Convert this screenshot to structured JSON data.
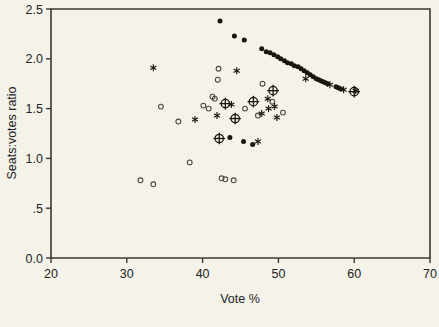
{
  "chart_data": {
    "type": "scatter",
    "title": "",
    "xlabel": "Vote %",
    "ylabel": "Seats:votes ratio",
    "xlim": [
      20,
      70
    ],
    "ylim": [
      0,
      2.5
    ],
    "xticks": [
      20,
      30,
      40,
      50,
      60,
      70
    ],
    "xtick_labels": [
      "20",
      "30",
      "40",
      "50",
      "60",
      "70"
    ],
    "yticks": [
      0,
      0.5,
      1.0,
      1.5,
      2.0,
      2.5
    ],
    "ytick_labels": [
      "0.0",
      ".5",
      "1.0",
      "1.5",
      "2.0",
      "2.5"
    ],
    "grid": false,
    "legend": "none",
    "series": [
      {
        "name": "filled-circle",
        "marker": "filled-circle",
        "points": [
          [
            42.3,
            2.38
          ],
          [
            44.2,
            2.23
          ],
          [
            45.5,
            2.19
          ],
          [
            47.8,
            2.1
          ],
          [
            48.4,
            2.07
          ],
          [
            48.9,
            2.06
          ],
          [
            49.4,
            2.04
          ],
          [
            49.9,
            2.02
          ],
          [
            50.3,
            2.0
          ],
          [
            50.8,
            1.98
          ],
          [
            51.2,
            1.96
          ],
          [
            51.7,
            1.95
          ],
          [
            52.1,
            1.93
          ],
          [
            52.6,
            1.92
          ],
          [
            53.0,
            1.9
          ],
          [
            53.4,
            1.88
          ],
          [
            53.8,
            1.86
          ],
          [
            54.2,
            1.84
          ],
          [
            54.6,
            1.82
          ],
          [
            55.0,
            1.8
          ],
          [
            55.3,
            1.79
          ],
          [
            55.6,
            1.78
          ],
          [
            55.9,
            1.77
          ],
          [
            56.2,
            1.76
          ],
          [
            56.5,
            1.75
          ],
          [
            57.6,
            1.72
          ],
          [
            57.9,
            1.71
          ],
          [
            58.2,
            1.7
          ],
          [
            45.4,
            1.17
          ],
          [
            46.6,
            1.14
          ],
          [
            43.6,
            1.21
          ]
        ]
      },
      {
        "name": "open-circle",
        "marker": "open-circle",
        "points": [
          [
            31.8,
            0.78
          ],
          [
            33.5,
            0.74
          ],
          [
            34.5,
            1.52
          ],
          [
            36.8,
            1.37
          ],
          [
            38.3,
            0.96
          ],
          [
            40.1,
            1.53
          ],
          [
            40.8,
            1.5
          ],
          [
            41.3,
            1.62
          ],
          [
            41.6,
            1.6
          ],
          [
            42.0,
            1.79
          ],
          [
            42.1,
            1.9
          ],
          [
            42.5,
            0.8
          ],
          [
            43.0,
            0.79
          ],
          [
            44.1,
            0.78
          ],
          [
            45.6,
            1.5
          ],
          [
            47.3,
            1.43
          ],
          [
            49.2,
            1.57
          ],
          [
            50.6,
            1.46
          ],
          [
            47.9,
            1.75
          ]
        ]
      },
      {
        "name": "asterisk",
        "marker": "asterisk",
        "points": [
          [
            33.5,
            1.91
          ],
          [
            39.0,
            1.39
          ],
          [
            41.9,
            1.43
          ],
          [
            43.8,
            1.54
          ],
          [
            44.5,
            1.88
          ],
          [
            47.8,
            1.45
          ],
          [
            48.6,
            1.6
          ],
          [
            48.7,
            1.5
          ],
          [
            49.5,
            1.52
          ],
          [
            49.8,
            1.41
          ],
          [
            47.3,
            1.17
          ],
          [
            53.6,
            1.8
          ],
          [
            56.8,
            1.74
          ],
          [
            58.6,
            1.69
          ],
          [
            60.2,
            1.68
          ]
        ]
      },
      {
        "name": "circled-plus",
        "marker": "circled-plus",
        "points": [
          [
            42.2,
            1.2
          ],
          [
            43.0,
            1.55
          ],
          [
            44.3,
            1.4
          ],
          [
            46.7,
            1.57
          ],
          [
            49.3,
            1.68
          ],
          [
            60.0,
            1.67
          ]
        ]
      }
    ]
  }
}
